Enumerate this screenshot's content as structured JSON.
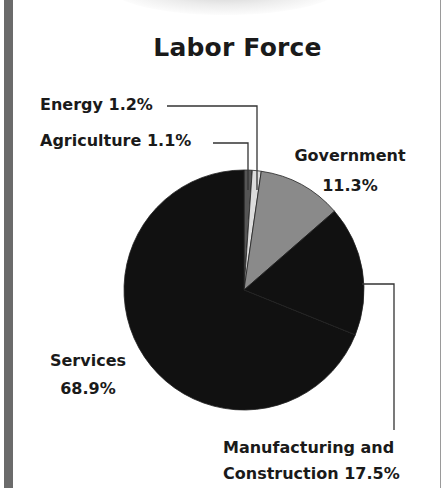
{
  "chart_data": {
    "type": "pie",
    "title": "Labor Force",
    "categories": [
      "Agriculture",
      "Energy",
      "Government",
      "Manufacturing and Construction",
      "Services"
    ],
    "values": [
      1.1,
      1.2,
      11.3,
      17.5,
      68.9
    ],
    "unit": "%",
    "start_angle": "12 o'clock",
    "direction": "clockwise",
    "colors": [
      "#555555",
      "#dcdcdc",
      "#8a8a8a",
      "#111111",
      "#111111"
    ],
    "legend": "none (leader-line labels)"
  },
  "labels": {
    "title": "Labor Force",
    "energy": "Energy 1.2%",
    "agriculture": "Agriculture 1.1%",
    "government_name": "Government",
    "government_value": "11.3%",
    "services_name": "Services",
    "services_value": "68.9%",
    "manufacturing_line1": "Manufacturing and",
    "manufacturing_line2": "Construction 17.5%"
  }
}
